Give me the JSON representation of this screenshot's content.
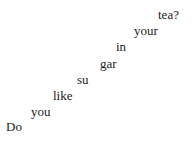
{
  "image": {
    "width": 194,
    "height": 146,
    "background_color": "#ffffff",
    "text_color": "#1b1b1b",
    "full_sentence": "Do you like sugar in your tea?"
  },
  "words": [
    {
      "text": "Do",
      "x": 6,
      "y": 120,
      "font_size": 13
    },
    {
      "text": "you",
      "x": 31,
      "y": 105,
      "font_size": 13
    },
    {
      "text": "like",
      "x": 53,
      "y": 89,
      "font_size": 13
    },
    {
      "text": "su",
      "x": 77,
      "y": 73,
      "font_size": 13
    },
    {
      "text": "gar",
      "x": 100,
      "y": 57,
      "font_size": 13
    },
    {
      "text": "in",
      "x": 116,
      "y": 40,
      "font_size": 13
    },
    {
      "text": "your",
      "x": 134,
      "y": 24,
      "font_size": 13
    },
    {
      "text": "tea?",
      "x": 158,
      "y": 8,
      "font_size": 13
    }
  ]
}
